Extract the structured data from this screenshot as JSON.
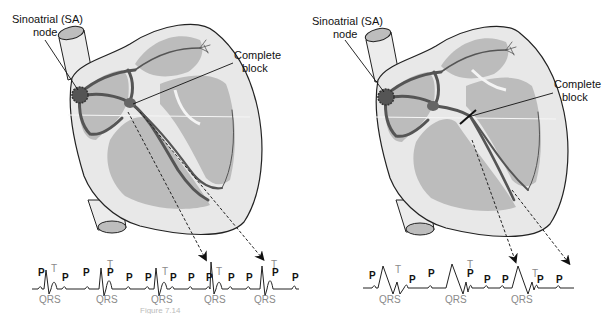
{
  "figure": {
    "panels": [
      {
        "id": "left",
        "labels": {
          "sa_node_line1": "Sinoatrial (SA)",
          "sa_node_line2": "node",
          "block_line1": "Complete",
          "block_line2": "block"
        },
        "ecg": {
          "p_label": "P",
          "t_label": "T",
          "qrs_label": "QRS",
          "qrs_count": 5
        }
      },
      {
        "id": "right",
        "labels": {
          "sa_node_line1": "Sinoatrial (SA)",
          "sa_node_line2": "node",
          "block_line1": "Complete",
          "block_line2": "block"
        },
        "ecg": {
          "p_label": "P",
          "t_label": "T",
          "qrs_label": "QRS",
          "qrs_count": 3
        }
      }
    ],
    "caption_fragment": "Figure 7.14",
    "colors": {
      "outline": "#222222",
      "heart_fill": "#e6e6e6",
      "chamber_fill": "#b9b9b9",
      "conduction": "#555555",
      "wave_label": "#8a8a8a"
    }
  }
}
